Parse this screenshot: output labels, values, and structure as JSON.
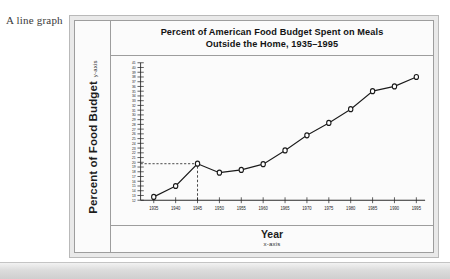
{
  "figure": {
    "caption": "A line graph"
  },
  "chart": {
    "title_line1": "Percent of American Food Budget Spent on Meals",
    "title_line2": "Outside the Home, 1935–1995",
    "y_axis_label": "Percent of Food Budget",
    "y_axis_sublabel": "y-axis",
    "x_axis_label": "Year",
    "x_axis_sublabel": "x-axis",
    "line_color": "#1a1a1a",
    "marker_fill": "#ffffff",
    "guide_style": "dashed"
  },
  "chart_data": {
    "type": "line",
    "title": "Percent of American Food Budget Spent on Meals Outside the Home, 1935–1995",
    "xlabel": "Year",
    "ylabel": "Percent of Food Budget",
    "categories": [
      1935,
      1940,
      1945,
      1950,
      1955,
      1960,
      1965,
      1970,
      1975,
      1980,
      1985,
      1990,
      1995
    ],
    "values": [
      12.7,
      15.0,
      19.7,
      17.8,
      18.4,
      19.6,
      22.5,
      25.7,
      28.3,
      31.2,
      35.0,
      36.0,
      38.0
    ],
    "xlim": [
      1932,
      1997
    ],
    "ylim": [
      12,
      41
    ],
    "ytick_labels": [
      41,
      40,
      39,
      38,
      37,
      36,
      35,
      34,
      33,
      32,
      31,
      30,
      29,
      28,
      27,
      26,
      25,
      24,
      23,
      22,
      21,
      20,
      19,
      18,
      17,
      16,
      15,
      14,
      13,
      12
    ],
    "xtick_labels": [
      "1935",
      "1940",
      "1945",
      "1950",
      "1955",
      "1960",
      "1965",
      "1970",
      "1975",
      "1980",
      "1985",
      "1990",
      "1995"
    ],
    "grid": false,
    "legend": null,
    "annotations": [
      {
        "type": "guide-horizontal",
        "y": 19.7,
        "from_x": 1932,
        "to_x": 1945,
        "style": "dashed"
      },
      {
        "type": "guide-vertical",
        "x": 1945,
        "from_y": 12,
        "to_y": 19.7,
        "style": "dashed"
      }
    ]
  }
}
